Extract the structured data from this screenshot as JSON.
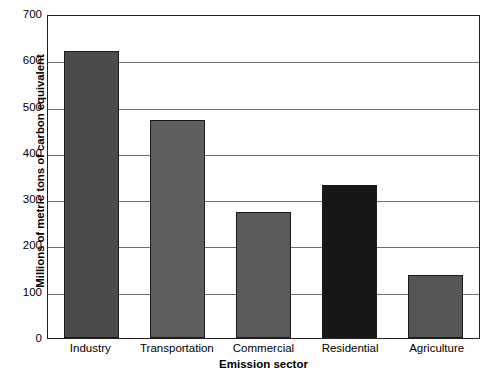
{
  "chart_data": {
    "type": "bar",
    "title": "",
    "xlabel": "Emission sector",
    "ylabel": "Millions of metric tons of carbon equivalent",
    "categories": [
      "Industry",
      "Transportation",
      "Commercial",
      "Residential",
      "Agriculture"
    ],
    "values": [
      620,
      472,
      272,
      330,
      137
    ],
    "series": [
      {
        "name": "Carbon emissions",
        "values": [
          620,
          472,
          272,
          330,
          137
        ]
      }
    ],
    "bar_colors": [
      "#4b4b4b",
      "#5e5e5e",
      "#5a5a5a",
      "#171717",
      "#565656"
    ],
    "ylim": [
      0,
      700
    ],
    "yticks": [
      0,
      100,
      200,
      300,
      400,
      500,
      600,
      700
    ],
    "ytick_labels": [
      "0",
      "100",
      "200",
      "300",
      "400",
      "500",
      "600",
      "700"
    ],
    "grid": true,
    "grid_axis": "y",
    "legend": null,
    "legend_position": "none",
    "axis_color": "#231f20",
    "grid_color": "#6f6f6f",
    "background": "#ffffff"
  }
}
